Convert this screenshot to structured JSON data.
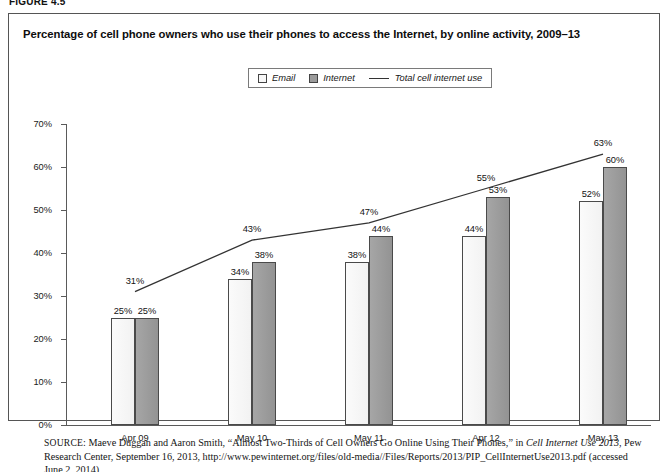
{
  "figure": {
    "label": "FIGURE 4.5"
  },
  "chart_title": "Percentage of cell phone owners who use their phones to access the Internet, by online activity, 2009–13",
  "legend": {
    "items": [
      {
        "label": "Email",
        "marker": "square-swatch-light",
        "color": "#f7f7f7"
      },
      {
        "label": "Internet",
        "marker": "square-swatch-gray",
        "color": "#9b9b9b"
      },
      {
        "label": "Total cell internet use",
        "marker": "line-swatch",
        "color": "#333333"
      }
    ]
  },
  "chart_data": {
    "type": "bar",
    "title": "Percentage of cell phone owners who use their phones to access the Internet, by online activity, 2009–13",
    "xlabel": "",
    "ylabel": "",
    "ylim": [
      0,
      70
    ],
    "ytick_labels": [
      "0%",
      "10%",
      "20%",
      "30%",
      "40%",
      "50%",
      "60%",
      "70%"
    ],
    "ytick_values": [
      0,
      10,
      20,
      30,
      40,
      50,
      60,
      70
    ],
    "grid": false,
    "legend_position": "top-center",
    "categories": [
      "Apr 09",
      "May 10",
      "May 11",
      "Apr 12",
      "May 13"
    ],
    "series": [
      {
        "name": "Email",
        "kind": "bar",
        "values": [
          25,
          34,
          38,
          44,
          52
        ],
        "data_labels": [
          "25%",
          "34%",
          "38%",
          "44%",
          "52%"
        ],
        "color": "#f7f7f7"
      },
      {
        "name": "Internet",
        "kind": "bar",
        "values": [
          25,
          38,
          44,
          53,
          60
        ],
        "data_labels": [
          "25%",
          "38%",
          "44%",
          "53%",
          "60%"
        ],
        "color": "#9b9b9b"
      },
      {
        "name": "Total cell internet use",
        "kind": "line",
        "values": [
          31,
          43,
          47,
          55,
          63
        ],
        "data_labels": [
          "31%",
          "43%",
          "47%",
          "55%",
          "63%"
        ],
        "color": "#333333"
      }
    ]
  },
  "source": {
    "prefix": "SOURCE",
    "text_before_italic": ": Maeve Duggan and Aaron Smith, “Almost Two-Thirds of Cell Owners Go Online Using Their Phones,” in ",
    "italic_title": "Cell Internet Use 2013",
    "text_after_italic": ", Pew Research Center, September 16, 2013, http://www.pewinternet.org/files/old-media//Files/Reports/2013/PIP_CellInternetUse2013.pdf (accessed June 2, 2014)"
  }
}
